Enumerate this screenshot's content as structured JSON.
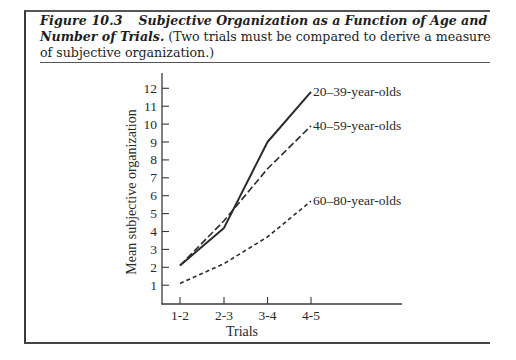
{
  "caption": {
    "figure_label": "Figure 10.3",
    "title": "Subjective Organization as a Function of Age and Number of Trials.",
    "note": "(Two trials must be compared to derive a measure of subjective organization.)"
  },
  "chart_data": {
    "type": "line",
    "title": "Subjective Organization as a Function of Age and Number of Trials",
    "xlabel": "Trials",
    "ylabel": "Mean subjective organization",
    "categories": [
      "1-2",
      "2-3",
      "3-4",
      "4-5"
    ],
    "yticks": [
      1,
      2,
      3,
      4,
      5,
      6,
      7,
      8,
      9,
      10,
      11,
      12
    ],
    "ylim": [
      0,
      13
    ],
    "grid": false,
    "legend_position": "inline labels at line ends",
    "series": [
      {
        "name": "20–39-year-olds",
        "style": "solid",
        "values": [
          2.1,
          4.2,
          9.0,
          11.8
        ]
      },
      {
        "name": "40–59-year-olds",
        "style": "long-dash",
        "values": [
          2.1,
          4.6,
          7.5,
          9.9
        ]
      },
      {
        "name": "60–80-year-olds",
        "style": "short-dash",
        "values": [
          1.1,
          2.2,
          3.7,
          5.7
        ]
      }
    ]
  }
}
